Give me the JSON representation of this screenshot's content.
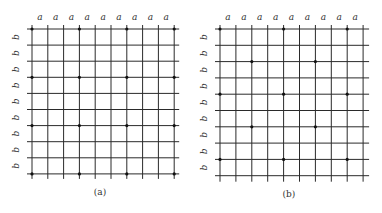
{
  "panels": [
    {
      "id": "a",
      "caption": "(a)",
      "col_label": "a",
      "row_label": "b",
      "columns": 10,
      "rows": 10,
      "col_label_count": 9,
      "row_label_count": 9,
      "pattern": "square lattice: point every 3 grid spacings in both directions",
      "points": [
        [
          0,
          0
        ],
        [
          0,
          3
        ],
        [
          0,
          6
        ],
        [
          0,
          9
        ],
        [
          3,
          0
        ],
        [
          3,
          3
        ],
        [
          3,
          6
        ],
        [
          3,
          9
        ],
        [
          6,
          0
        ],
        [
          6,
          3
        ],
        [
          6,
          6
        ],
        [
          6,
          9
        ],
        [
          9,
          0
        ],
        [
          9,
          3
        ],
        [
          9,
          6
        ],
        [
          9,
          9
        ]
      ]
    },
    {
      "id": "b",
      "caption": "(b)",
      "col_label": "a",
      "row_label": "b",
      "columns": 10,
      "rows": 10,
      "col_label_count": 9,
      "row_label_count": 9,
      "pattern": "centered lattice: points every 4 columns on even-of-4 rows, offset by 2 on intermediate rows",
      "points": [
        [
          0,
          0
        ],
        [
          0,
          4
        ],
        [
          0,
          8
        ],
        [
          2,
          2
        ],
        [
          2,
          6
        ],
        [
          4,
          0
        ],
        [
          4,
          4
        ],
        [
          4,
          8
        ],
        [
          6,
          2
        ],
        [
          6,
          6
        ],
        [
          8,
          0
        ],
        [
          8,
          4
        ],
        [
          8,
          8
        ]
      ]
    }
  ]
}
